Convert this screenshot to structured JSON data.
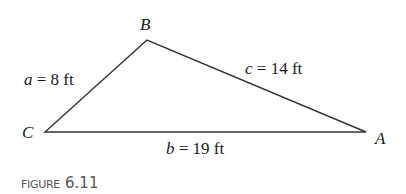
{
  "figure": {
    "caption_word": "FIGURE",
    "caption_number": "6.11"
  },
  "vertices": {
    "A": {
      "label": "A",
      "x": 366,
      "y": 132
    },
    "B": {
      "label": "B",
      "x": 147,
      "y": 40
    },
    "C": {
      "label": "C",
      "x": 45,
      "y": 132
    }
  },
  "sides": {
    "a": {
      "var": "a",
      "eq": " = 8 ft",
      "length": 8,
      "unit": "ft",
      "between": [
        "B",
        "C"
      ]
    },
    "b": {
      "var": "b",
      "eq": " = 19 ft",
      "length": 19,
      "unit": "ft",
      "between": [
        "C",
        "A"
      ]
    },
    "c": {
      "var": "c",
      "eq": " = 14 ft",
      "length": 14,
      "unit": "ft",
      "between": [
        "A",
        "B"
      ]
    }
  },
  "colors": {
    "line": "#333333",
    "text": "#1a1a1a",
    "caption": "#555555"
  }
}
